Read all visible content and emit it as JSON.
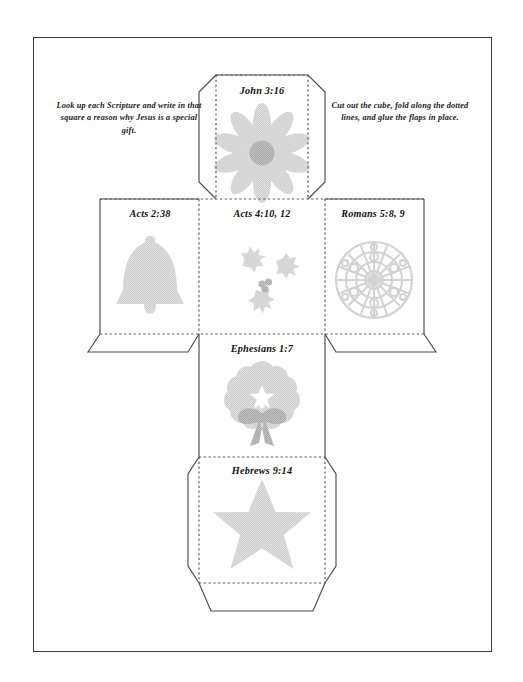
{
  "document": {
    "type": "printable-craft-worksheet",
    "title": "Scripture Gift Cube",
    "page_background": "#ffffff",
    "border_color": "#3a3a3a",
    "art_fill": "#d6d6d6",
    "art_fill_dark": "#b4b4b4",
    "fold_line_style": "dotted",
    "cut_line_style": "solid"
  },
  "instructions": {
    "left": "Look up each Scripture and write in that square a reason why Jesus is a special gift.",
    "right": "Cut out the cube, fold along the dotted lines, and glue the flaps in place."
  },
  "net": {
    "layout": "cross",
    "panels": [
      {
        "id": "john",
        "title": "John 3:16",
        "icon": "flower-icon",
        "position": "top"
      },
      {
        "id": "acts238",
        "title": "Acts 2:38",
        "icon": "bell-icon",
        "position": "middle-left"
      },
      {
        "id": "acts410",
        "title": "Acts 4:10, 12",
        "icon": "holly-icon",
        "position": "middle-center"
      },
      {
        "id": "romans",
        "title": "Romans 5:8, 9",
        "icon": "ornament-icon",
        "position": "middle-right"
      },
      {
        "id": "eph",
        "title": "Ephesians 1:7",
        "icon": "wreath-icon",
        "position": "lower-center"
      },
      {
        "id": "heb",
        "title": "Hebrews 9:14",
        "icon": "star-icon",
        "position": "bottom"
      }
    ]
  }
}
